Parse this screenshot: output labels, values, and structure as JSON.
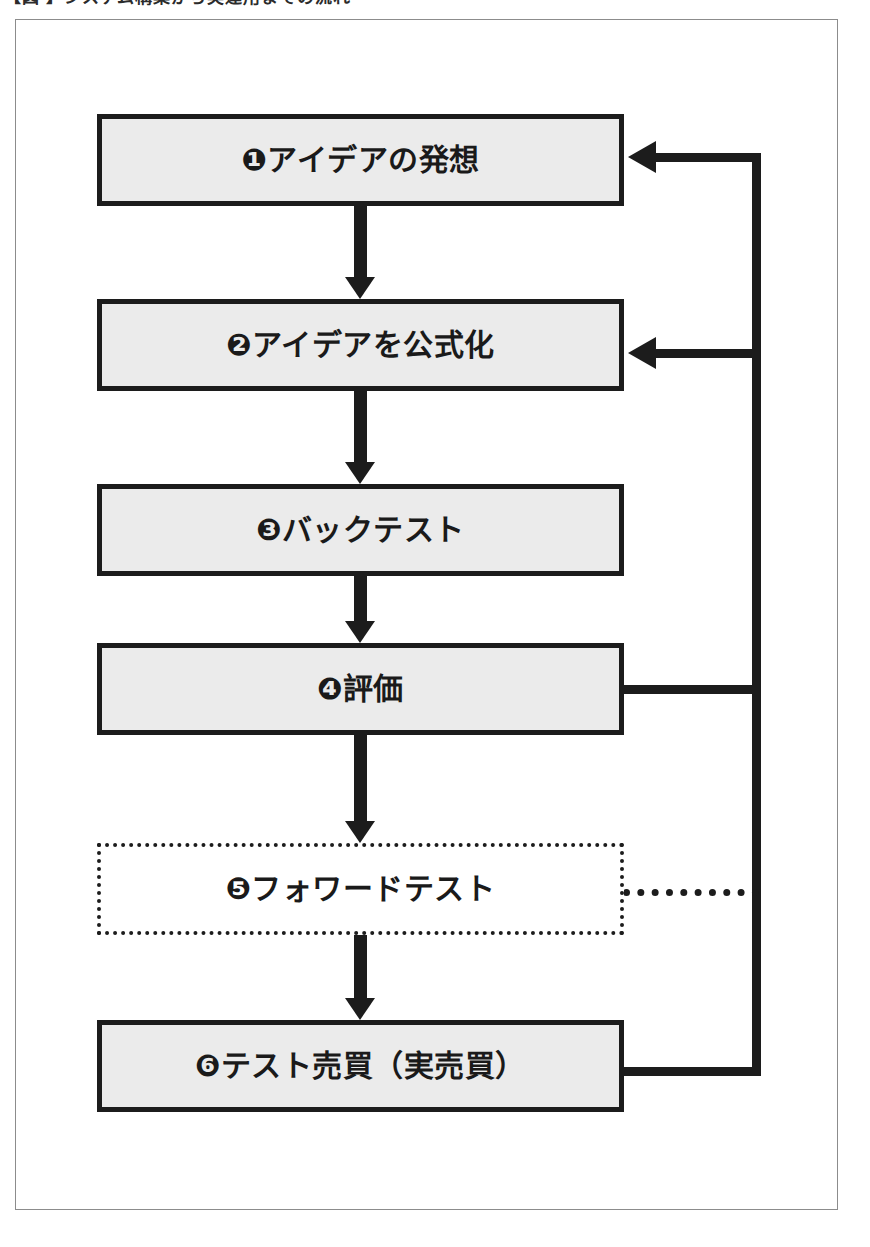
{
  "caption": {
    "text": "【図     】システム構築から実運用までの流れ",
    "visible_note": "clipped at top of image"
  },
  "diagram": {
    "orientation": "top-to-bottom",
    "frame_color": "#8c8c8c",
    "box_fill": "#ebebeb",
    "box_border": "#1c1c1c",
    "arrow_color": "#1c1c1c",
    "nodes": [
      {
        "id": "n1",
        "number": "❶",
        "label": "❶アイデアの発想",
        "text": "アイデアの発想",
        "style": "solid"
      },
      {
        "id": "n2",
        "number": "❷",
        "label": "❷アイデアを公式化",
        "text": "アイデアを公式化",
        "style": "solid"
      },
      {
        "id": "n3",
        "number": "❸",
        "label": "❸バックテスト",
        "text": "バックテスト",
        "style": "solid"
      },
      {
        "id": "n4",
        "number": "❹",
        "label": "❹評価",
        "text": "評価",
        "style": "solid"
      },
      {
        "id": "n5",
        "number": "❺",
        "label": "❺フォワードテスト",
        "text": "フォワードテスト",
        "style": "dotted"
      },
      {
        "id": "n6",
        "number": "❻",
        "label": "❻テスト売買（実売買）",
        "text": "テスト売買（実売買）",
        "style": "solid"
      }
    ],
    "edges": [
      {
        "from": "n1",
        "to": "n2",
        "kind": "down-arrow",
        "style": "solid"
      },
      {
        "from": "n2",
        "to": "n3",
        "kind": "down-arrow",
        "style": "solid"
      },
      {
        "from": "n3",
        "to": "n4",
        "kind": "down-arrow",
        "style": "solid"
      },
      {
        "from": "n4",
        "to": "n5",
        "kind": "down-arrow",
        "style": "solid"
      },
      {
        "from": "n5",
        "to": "n6",
        "kind": "down-arrow",
        "style": "solid"
      },
      {
        "from": "n6",
        "to": "n1",
        "kind": "feedback",
        "style": "solid"
      },
      {
        "from": "n6",
        "to": "n2",
        "kind": "feedback",
        "style": "solid"
      },
      {
        "from": "n4",
        "to": "feedback-bus",
        "kind": "feedback-join",
        "style": "solid"
      },
      {
        "from": "n5",
        "to": "feedback-bus",
        "kind": "feedback-join",
        "style": "dotted"
      }
    ]
  }
}
